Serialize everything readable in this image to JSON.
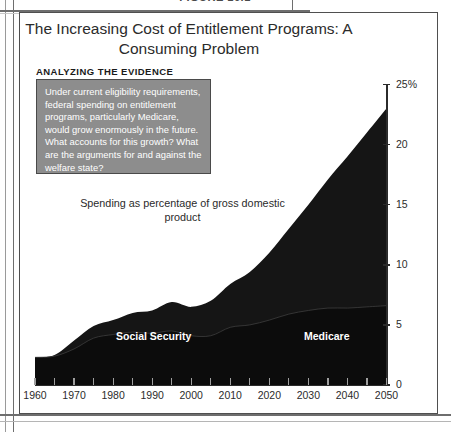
{
  "page": {
    "figure_caption": "FIGURE 16.1",
    "title": "The Increasing Cost of Entitlement Programs:\nA Consuming Problem",
    "evidence_label": "ANALYZING THE EVIDENCE",
    "callout_text": "Under current eligibility requirements, federal spending on entitlement programs, particularly Medicare, would grow enormously in the future. What accounts for this growth? What are the arguments for and against the welfare state?",
    "gdp_note": "Spending as percentage of gross domestic product"
  },
  "colors": {
    "area_fill": "#151515",
    "callout_fill": "#8d8d8d",
    "callout_border": "#4a4a4a",
    "axis": "#2b2b2b",
    "frame": "#4f4f4f",
    "series_label": "#ffffff"
  },
  "chart_data": {
    "type": "area",
    "title": "The Increasing Cost of Entitlement Programs: A Consuming Problem",
    "subtitle": "Spending as percentage of gross domestic product",
    "xlabel": "",
    "ylabel": "Spending as percentage of gross domestic product",
    "ylim": [
      0,
      25
    ],
    "xlim": [
      1960,
      2050
    ],
    "grid": false,
    "legend": "inline-labels",
    "stacked": true,
    "y_ticks": [
      0,
      5,
      10,
      15,
      20,
      25
    ],
    "y_tick_labels": [
      "0",
      "5",
      "10",
      "15",
      "20",
      "25%"
    ],
    "x_ticks": [
      1960,
      1970,
      1980,
      1990,
      2000,
      2010,
      2020,
      2030,
      2040,
      2050
    ],
    "x_tick_labels": [
      "1960",
      "1970",
      "1980",
      "1990",
      "2000",
      "2010",
      "2020",
      "2030",
      "2040",
      "2050"
    ],
    "x_minor_ticks": [
      1965,
      1975,
      1985,
      1995,
      2005,
      2015,
      2025,
      2035,
      2045
    ],
    "x": [
      1960,
      1965,
      1970,
      1975,
      1980,
      1985,
      1990,
      1995,
      2000,
      2005,
      2010,
      2015,
      2020,
      2025,
      2030,
      2035,
      2040,
      2045,
      2050
    ],
    "series": [
      {
        "name": "Social Security",
        "label_position": "inside-lower-left",
        "values": [
          2.3,
          2.4,
          3.0,
          3.9,
          4.2,
          4.4,
          4.3,
          4.5,
          4.1,
          4.1,
          4.8,
          5.0,
          5.4,
          5.9,
          6.2,
          6.4,
          6.4,
          6.5,
          6.6
        ]
      },
      {
        "name": "Medicare",
        "label_position": "inside-upper-right",
        "values": [
          0.0,
          0.1,
          0.7,
          1.0,
          1.2,
          1.6,
          1.9,
          2.4,
          2.4,
          2.9,
          3.6,
          4.4,
          5.6,
          7.1,
          8.8,
          10.7,
          12.6,
          14.5,
          16.4
        ]
      }
    ],
    "totals": [
      2.3,
      2.5,
      3.7,
      4.9,
      5.4,
      6.0,
      6.2,
      6.9,
      6.5,
      7.0,
      8.4,
      9.4,
      11.0,
      13.0,
      15.0,
      17.1,
      19.0,
      21.0,
      23.0
    ]
  }
}
